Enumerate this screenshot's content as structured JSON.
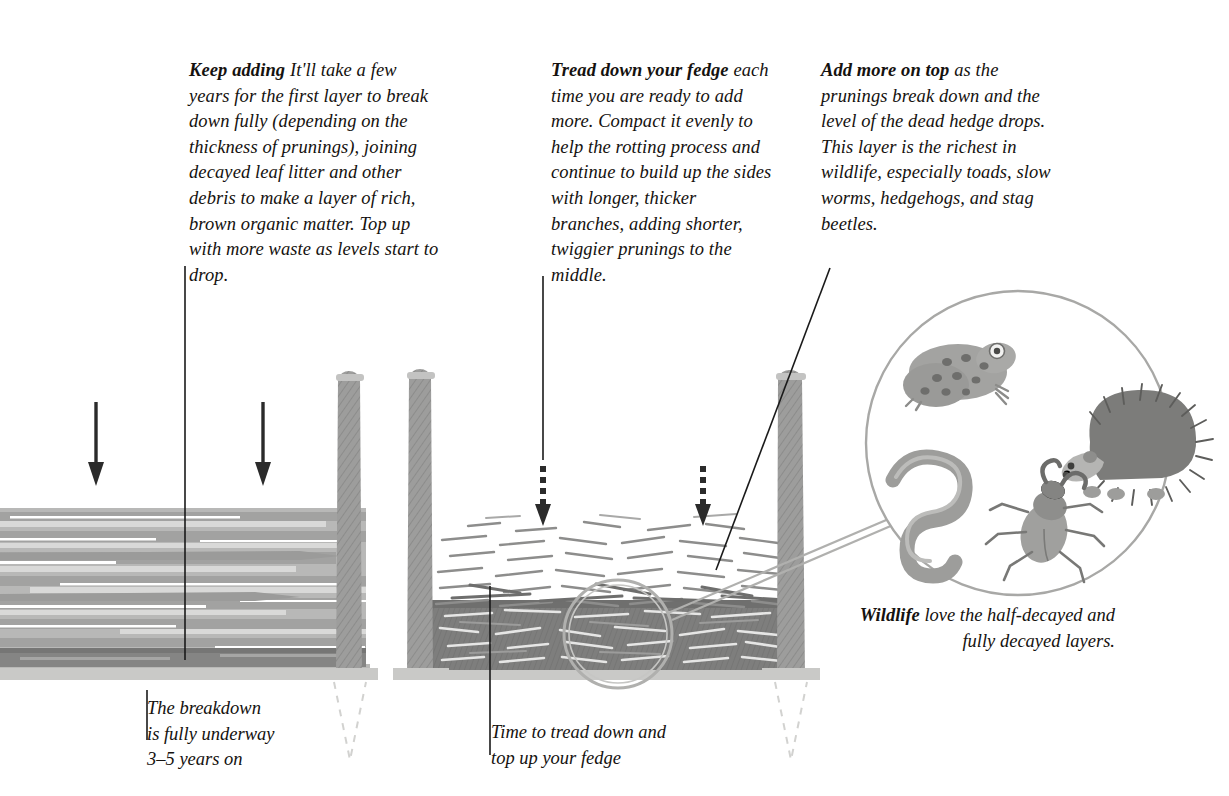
{
  "illustration": {
    "title": "Dead hedge (fedge) decomposition stages",
    "colors": {
      "ink": "#15120f",
      "post": "#9a9a99",
      "post_top": "#c3c3c2",
      "ground": "#c9c9c7",
      "ground_shadow": "#b4b4b2",
      "log_mid": "#a9a9a8",
      "log_dark": "#8f8f8e",
      "log_light": "#d2d2d1",
      "compacted_dark": "#7e7e7d",
      "twig_grey": "#8d8d8c",
      "magnifier_stroke": "#a8a8a6",
      "dashed_stake": "#cfcfcd",
      "animal_grey": "#9b9b99",
      "animal_dark": "#6f6f6d"
    }
  },
  "notes": {
    "keep_adding": {
      "lead": "Keep adding",
      "body": " It'll take a few years for the first layer to break down fully (depending on the thickness of prunings), joining decayed leaf litter and other debris to make a layer of rich, brown organic matter. Top up with more waste as levels start to drop."
    },
    "tread_down": {
      "lead": "Tread down your fedge",
      "body": " each time you are ready to add more. Compact it evenly to help the rotting process and continue to build up the sides with longer, thicker branches, adding shorter, twiggier prunings to the middle."
    },
    "add_more": {
      "lead": "Add more on top",
      "body": " as the prunings break down and the level of the dead hedge drops. This layer is the richest in wildlife, especially toads, slow worms, hedgehogs, and stag beetles."
    }
  },
  "captions": {
    "breakdown": {
      "line1": "The breakdown",
      "line2": "is fully underway",
      "line3": "3–5 years on"
    },
    "tread": {
      "line1": "Time to tread down and",
      "line2": "top up your fedge"
    },
    "wildlife": {
      "lead": "Wildlife",
      "body": " love the half-decayed and fully decayed layers."
    }
  },
  "wildlife_detail": {
    "creatures": [
      "toad",
      "slow-worm",
      "hedgehog",
      "stag-beetle"
    ]
  },
  "piles": {
    "left": {
      "label": "fully decayed pile",
      "layers": [
        "long horizontal branches",
        "dark compacted base"
      ]
    },
    "centre": {
      "label": "freshly topped-up pile",
      "layers": [
        "loose twiggy top layer",
        "dark trodden-down layer"
      ]
    }
  },
  "arrows": {
    "left": [
      "solid-down-arrow",
      "solid-down-arrow"
    ],
    "centre": [
      "dashed-down-arrow",
      "dashed-down-arrow"
    ]
  },
  "posts": [
    "stake-1",
    "stake-2",
    "stake-3"
  ]
}
